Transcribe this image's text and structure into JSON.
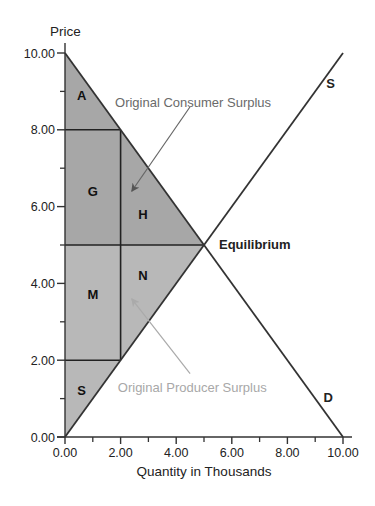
{
  "chart_data": {
    "type": "supply-demand",
    "title": "",
    "xlabel": "Quantity in Thousands",
    "ylabel": "Price",
    "xlim": [
      0,
      10
    ],
    "ylim": [
      0,
      10
    ],
    "x_ticks": [
      "0.00",
      "2.00",
      "4.00",
      "6.00",
      "8.00",
      "10.00"
    ],
    "y_ticks": [
      "0.00",
      "2.00",
      "4.00",
      "6.00",
      "8.00",
      "10.00"
    ],
    "x_tick_values": [
      0,
      2,
      4,
      6,
      8,
      10
    ],
    "y_tick_values": [
      0,
      2,
      4,
      6,
      8,
      10
    ],
    "minor_tick_values": [
      1,
      3,
      5,
      7,
      9
    ],
    "curves": [
      {
        "name": "S",
        "label": "S",
        "points": [
          [
            0,
            0
          ],
          [
            10,
            10
          ]
        ]
      },
      {
        "name": "D",
        "label": "D",
        "points": [
          [
            0,
            10
          ],
          [
            10,
            0
          ]
        ]
      }
    ],
    "equilibrium": {
      "label": "Equilibrium",
      "x": 5,
      "y": 5
    },
    "consumer_surplus_color": "#a7a7a7",
    "producer_surplus_color": "#b8b8b8",
    "regions": [
      {
        "label": "A",
        "group": "consumer",
        "polygon": [
          [
            0,
            10
          ],
          [
            0,
            8
          ],
          [
            2,
            8
          ]
        ],
        "label_at": [
          0.6,
          8.9
        ]
      },
      {
        "label": "G",
        "group": "consumer",
        "polygon": [
          [
            0,
            8
          ],
          [
            2,
            8
          ],
          [
            2,
            5
          ],
          [
            0,
            5
          ]
        ],
        "label_at": [
          1.0,
          6.4
        ]
      },
      {
        "label": "H",
        "group": "consumer",
        "polygon": [
          [
            2,
            8
          ],
          [
            5,
            5
          ],
          [
            2,
            5
          ]
        ],
        "label_at": [
          2.8,
          5.8
        ]
      },
      {
        "label": "M",
        "group": "producer",
        "polygon": [
          [
            0,
            5
          ],
          [
            2,
            5
          ],
          [
            2,
            2
          ],
          [
            0,
            2
          ]
        ],
        "label_at": [
          1.0,
          3.7
        ]
      },
      {
        "label": "N",
        "group": "producer",
        "polygon": [
          [
            2,
            5
          ],
          [
            5,
            5
          ],
          [
            2,
            2
          ]
        ],
        "label_at": [
          2.8,
          4.2
        ]
      },
      {
        "label": "S",
        "group": "producer",
        "polygon": [
          [
            0,
            2
          ],
          [
            2,
            2
          ],
          [
            0,
            0
          ]
        ],
        "label_at": [
          0.6,
          1.2
        ]
      }
    ],
    "divider_lines": [
      [
        [
          0,
          8
        ],
        [
          2,
          8
        ]
      ],
      [
        [
          2,
          8
        ],
        [
          2,
          2
        ]
      ],
      [
        [
          0,
          5
        ],
        [
          5,
          5
        ]
      ],
      [
        [
          0,
          2
        ],
        [
          2,
          2
        ]
      ]
    ],
    "annotations": [
      {
        "text": "Original Consumer Surplus",
        "group": "consumer",
        "text_at": [
          1.8,
          8.7
        ],
        "arrow_from": [
          4.5,
          8.6
        ],
        "arrow_to": [
          2.4,
          6.4
        ]
      },
      {
        "text": "Original Producer Surplus",
        "group": "producer",
        "text_at": [
          1.9,
          1.3
        ],
        "arrow_from": [
          4.5,
          1.65
        ],
        "arrow_to": [
          2.4,
          3.6
        ]
      }
    ]
  }
}
